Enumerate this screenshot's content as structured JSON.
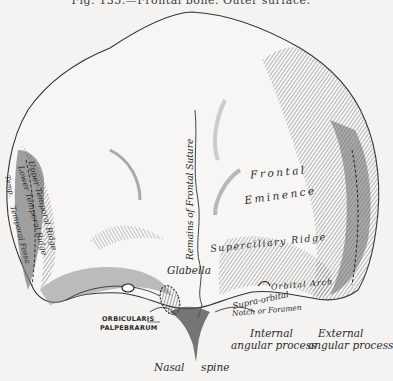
{
  "figure": {
    "caption": "Fig. 135.—Frontal bone. Outer surface.",
    "colors": {
      "background": "#f4f3f1",
      "ink": "#2a2a2a",
      "shade_dark": "#555555",
      "shade_mid": "#8a8a8a",
      "shade_light": "#c4c4c4"
    }
  },
  "labels": {
    "frontal": "Frontal",
    "eminence": "Eminence",
    "remains_frontal_suture": "Remains of Frontal Suture",
    "superciliary_ridge": "Superciliary Ridge",
    "glabella": "Glabella",
    "orbital_arch": "Orbital Arch",
    "supraorbital_1": "Supra-orbital",
    "supraorbital_2": "Notch or Foramen",
    "internal_1": "Internal",
    "internal_2": "angular process",
    "external_1": "External",
    "external_2": "angular process",
    "nasal": "Nasal",
    "spine": "spine",
    "orbicularis_1": "ORBICULARIS",
    "orbicularis_2": "PALPEBRARUM",
    "upper_temporal_ridge": "Upper Temporal Ridge",
    "lower_temporal_ridge": "Lower Temporal Ridge",
    "temporal_fossa": "Temporal Fossa",
    "temporal_left": "Temp."
  }
}
